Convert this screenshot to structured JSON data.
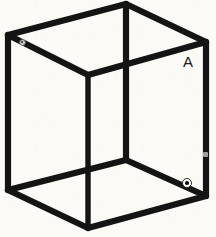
{
  "figure": {
    "background_color": "#fbfaf7",
    "line_color": "#141414",
    "width": 216,
    "height": 237
  },
  "labels": {
    "vertex_a": "A"
  },
  "markers": {
    "bottom_right": {
      "name": "circled-point",
      "x": 187,
      "y": 183,
      "fill_color": "#ffffff",
      "dot_color": "#111111"
    },
    "top_left": {
      "name": "faint-point",
      "x": 22,
      "y": 42
    },
    "right_edge": {
      "name": "faint-mark",
      "x": 205,
      "y": 154
    }
  },
  "geometry": {
    "vertices": {
      "top_back": [
        126,
        4
      ],
      "top_left": [
        8,
        35
      ],
      "top_right": [
        206,
        42
      ],
      "front_top": [
        88,
        75
      ],
      "bottom_left": [
        8,
        190
      ],
      "bottom_right": [
        206,
        196
      ],
      "front_bottom": [
        88,
        228
      ],
      "back_bottom": [
        126,
        160
      ]
    },
    "edges": [
      [
        "top_left",
        "top_back"
      ],
      [
        "top_back",
        "top_right"
      ],
      [
        "top_left",
        "front_top"
      ],
      [
        "front_top",
        "top_right"
      ],
      [
        "top_back",
        "back_bottom"
      ],
      [
        "top_left",
        "bottom_left"
      ],
      [
        "top_right",
        "bottom_right"
      ],
      [
        "front_top",
        "front_bottom"
      ],
      [
        "bottom_left",
        "back_bottom"
      ],
      [
        "back_bottom",
        "bottom_right"
      ],
      [
        "bottom_left",
        "front_bottom"
      ],
      [
        "front_bottom",
        "bottom_right"
      ]
    ]
  }
}
